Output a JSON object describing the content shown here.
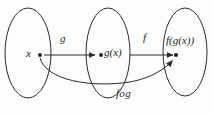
{
  "diagram": {
    "type": "function-composition-mapping-diagram",
    "background_color": "#fdfdfd",
    "stroke_color": "#2b2b2b",
    "sets": [
      {
        "id": "domain",
        "label": ""
      },
      {
        "id": "intermediate",
        "label": ""
      },
      {
        "id": "codomain",
        "label": ""
      }
    ],
    "elements": {
      "x_label": "x",
      "gx_label": "g(x)",
      "fgx_label": "f(g(x))"
    },
    "arrows": {
      "g_label": "g",
      "f_label": "f",
      "composition_label": "fog"
    }
  }
}
